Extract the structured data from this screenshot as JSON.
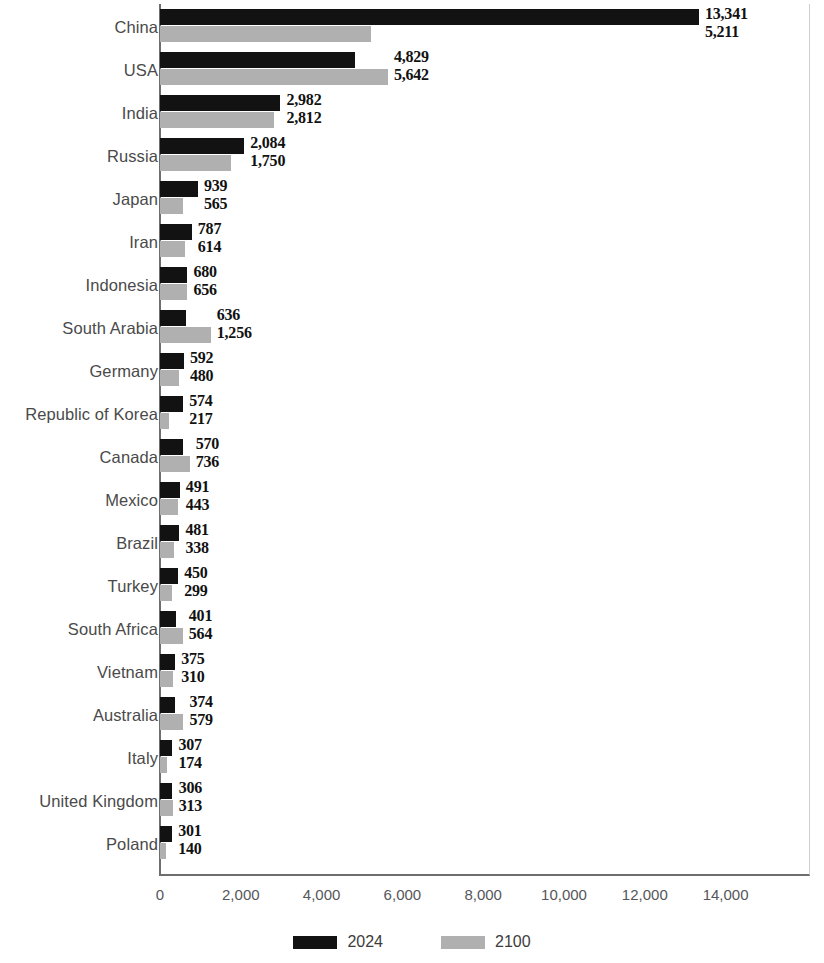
{
  "chart_data": {
    "type": "bar",
    "orientation": "horizontal",
    "title": "",
    "subtitle": "",
    "xlabel": "",
    "ylabel": "",
    "xlim": [
      0,
      15000
    ],
    "xticks": [
      0,
      2000,
      4000,
      6000,
      8000,
      10000,
      12000,
      14000
    ],
    "xtick_labels": [
      "0",
      "2,000",
      "4,000",
      "6,000",
      "8,000",
      "10,000",
      "12,000",
      "14,000"
    ],
    "grid": false,
    "legend_position": "bottom-center",
    "categories": [
      "China",
      "USA",
      "India",
      "Russia",
      "Japan",
      "Iran",
      "Indonesia",
      "South Arabia",
      "Germany",
      "Republic of Korea",
      "Canada",
      "Mexico",
      "Brazil",
      "Turkey",
      "South Africa",
      "Vietnam",
      "Australia",
      "Italy",
      "United Kingdom",
      "Poland"
    ],
    "series": [
      {
        "name": "2024",
        "color": "#121212",
        "values": [
          13341,
          4829,
          2982,
          2084,
          939,
          787,
          680,
          636,
          592,
          574,
          570,
          491,
          481,
          450,
          401,
          375,
          374,
          307,
          306,
          301
        ],
        "value_labels": [
          "13,341",
          "4,829",
          "2,982",
          "2,084",
          "939",
          "787",
          "680",
          "636",
          "592",
          "574",
          "570",
          "491",
          "481",
          "450",
          "401",
          "375",
          "374",
          "307",
          "306",
          "301"
        ]
      },
      {
        "name": "2100",
        "color": "#b0b0b0",
        "values": [
          5211,
          5642,
          2812,
          1750,
          565,
          614,
          656,
          1256,
          480,
          217,
          736,
          443,
          338,
          299,
          564,
          310,
          579,
          174,
          313,
          140
        ],
        "value_labels": [
          "5,211",
          "5,642",
          "2,812",
          "1,750",
          "565",
          "614",
          "656",
          "1,256",
          "480",
          "217",
          "736",
          "443",
          "338",
          "299",
          "564",
          "310",
          "579",
          "174",
          "313",
          "140"
        ]
      }
    ]
  },
  "legend": {
    "items": [
      {
        "label": "2024",
        "color": "#121212"
      },
      {
        "label": "2100",
        "color": "#b0b0b0"
      }
    ]
  }
}
